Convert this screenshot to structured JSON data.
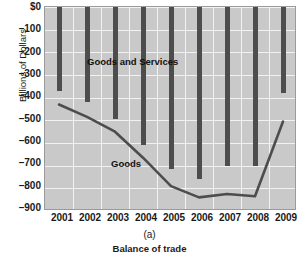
{
  "figure": {
    "panel_label": "(a)",
    "caption": "Balance of trade"
  },
  "axes": {
    "ylabel": "Billions of Dollars",
    "yticks": [
      "$0",
      "–100",
      "–200",
      "–300",
      "–400",
      "–500",
      "–600",
      "–700",
      "–800",
      "–900"
    ],
    "xticks": [
      "2001",
      "2002",
      "2003",
      "2004",
      "2005",
      "2006",
      "2007",
      "2008",
      "2009"
    ]
  },
  "annotations": {
    "goods_and_services": "Goods and Services",
    "goods": "Goods"
  },
  "colors": {
    "plot_background": "#c9c9c9",
    "gridline": "#f2f2f2",
    "bar": "#4d4d4d",
    "line": "#4d4d4d",
    "text": "#1a1a1a",
    "page_background": "#ffffff"
  },
  "chart_data": {
    "type": "bar",
    "title": "Balance of trade",
    "xlabel": "",
    "ylabel": "Billions of Dollars",
    "ylim": [
      -900,
      0
    ],
    "ytick_values": [
      0,
      -100,
      -200,
      -300,
      -400,
      -500,
      -600,
      -700,
      -800,
      -900
    ],
    "grid": true,
    "legend_position": "inline-annotations",
    "categories": [
      "2001",
      "2002",
      "2003",
      "2004",
      "2005",
      "2006",
      "2007",
      "2008",
      "2009"
    ],
    "series": [
      {
        "name": "Goods and Services",
        "type": "bar",
        "values": [
          -370,
          -420,
          -495,
          -610,
          -715,
          -760,
          -700,
          -700,
          -380
        ]
      },
      {
        "name": "Goods",
        "type": "line",
        "values": [
          -430,
          -485,
          -550,
          -665,
          -790,
          -840,
          -825,
          -835,
          -505
        ]
      }
    ]
  }
}
